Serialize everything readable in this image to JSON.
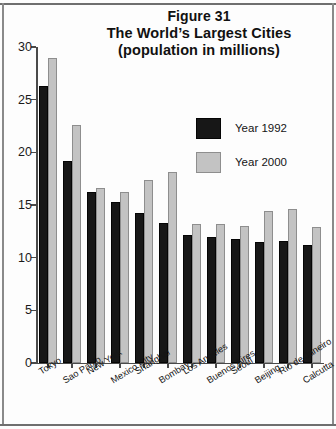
{
  "figure": {
    "title_lines": [
      "Figure 31",
      "The World’s Largest Cities",
      "(population in millions)"
    ]
  },
  "legend": {
    "position": "inside-top-right",
    "entries": [
      {
        "label": "Year 1992",
        "color": "#171717"
      },
      {
        "label": "Year 2000",
        "color": "#c3c3c3"
      }
    ]
  },
  "axes": {
    "y_ticks": [
      "0",
      "5",
      "10",
      "15",
      "20",
      "25",
      "30"
    ],
    "y_min": 0,
    "y_max": 30
  },
  "chart_data": {
    "type": "bar",
    "xlabel": "",
    "ylabel": "",
    "ylim": [
      0,
      30
    ],
    "ytick_step": 5,
    "grid": false,
    "legend_position": "inside-top-right",
    "categories": [
      "Tokyo",
      "Sao Paulo",
      "New York",
      "Mexico City",
      "Shanghai",
      "Bombay",
      "Los Angeles",
      "Buenos Aires",
      "Seoul",
      "Beijing",
      "Rio de Janeiro",
      "Calcutta"
    ],
    "series": [
      {
        "name": "Year 1992",
        "color": "#171717",
        "values": [
          26.3,
          19.2,
          16.2,
          15.3,
          14.2,
          13.3,
          12.2,
          12.0,
          11.8,
          11.5,
          11.6,
          11.2
        ]
      },
      {
        "name": "Year 2000",
        "color": "#c3c3c3",
        "values": [
          29.0,
          22.6,
          16.6,
          16.2,
          17.4,
          18.1,
          13.2,
          13.2,
          13.0,
          14.4,
          14.6,
          12.9
        ]
      }
    ]
  }
}
